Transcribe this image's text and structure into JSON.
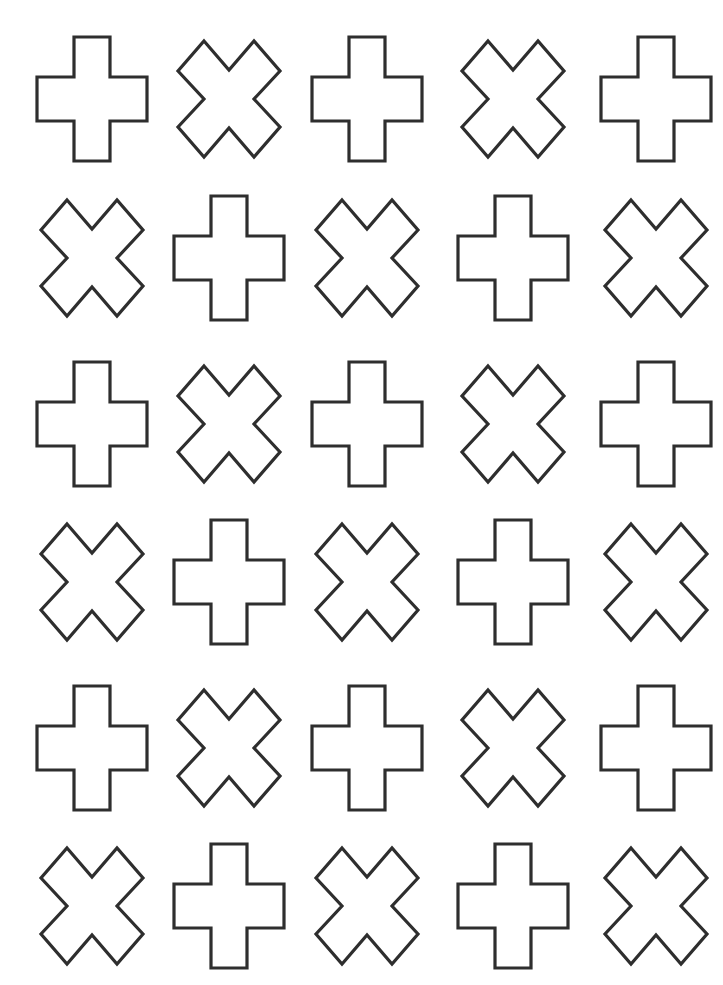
{
  "page": {
    "width": 723,
    "height": 985,
    "background": "#ffffff",
    "stroke_color": "#2e2e2e"
  },
  "grid": {
    "rows": 6,
    "columns": 5,
    "column_centers": [
      92,
      229,
      367,
      513,
      656
    ],
    "row_centers": [
      99,
      258,
      424,
      582,
      748,
      906
    ],
    "pattern": [
      [
        "plus",
        "x",
        "plus",
        "x",
        "plus"
      ],
      [
        "x",
        "plus",
        "x",
        "plus",
        "x"
      ],
      [
        "plus",
        "x",
        "plus",
        "x",
        "plus"
      ],
      [
        "x",
        "plus",
        "x",
        "plus",
        "x"
      ],
      [
        "plus",
        "x",
        "plus",
        "x",
        "plus"
      ],
      [
        "x",
        "plus",
        "x",
        "plus",
        "x"
      ]
    ]
  },
  "shapes": {
    "plus": {
      "icon": "plus-outline-icon",
      "path": "M-18,-62 L18,-62 L18,-22 L55,-22 L55,22 L18,22 L18,62 L-18,62 L-18,22 L-55,22 L-55,-22 L-18,-22 Z"
    },
    "x": {
      "icon": "x-outline-icon",
      "path": "M-25,-58 L0,-29 L25,-58 L51,-28 L25,0 L51,28 L25,58 L0,29 L-25,58 L-51,28 L-25,0 L-51,-28 Z"
    }
  }
}
